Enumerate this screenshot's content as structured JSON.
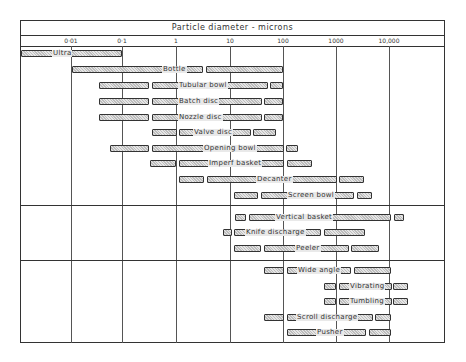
{
  "chart_data": {
    "type": "range-bar",
    "title": "Particle diameter - microns",
    "xlabel": "Particle diameter - microns",
    "xscale": "log",
    "xlim": [
      0.001,
      100000
    ],
    "tick_labels": [
      "0·01",
      "0·1",
      "1",
      "10",
      "100",
      "1000",
      "10,000"
    ],
    "tick_values": [
      0.01,
      0.1,
      1,
      10,
      100,
      1000,
      10000
    ],
    "groups": [
      {
        "name": "Sedimentation / disc-type",
        "rows": [
          {
            "label": "Ultra",
            "segments": [
              [
                0.001,
                0.1
              ]
            ]
          },
          {
            "label": "Bottle",
            "segments": [
              [
                0.01,
                2.5
              ],
              [
                3,
                100
              ]
            ]
          },
          {
            "label": "Tubular bowl",
            "segments": [
              [
                0.03,
                0.5
              ],
              [
                0.55,
                50
              ],
              [
                60,
                100
              ]
            ]
          },
          {
            "label": "Batch disc",
            "segments": [
              [
                0.03,
                0.5
              ],
              [
                0.55,
                40
              ],
              [
                45,
                100
              ]
            ]
          },
          {
            "label": "Nozzle disc",
            "segments": [
              [
                0.03,
                0.5
              ],
              [
                0.55,
                40
              ],
              [
                45,
                100
              ]
            ]
          },
          {
            "label": "Valve disc",
            "segments": [
              [
                0.55,
                1
              ],
              [
                1.1,
                25
              ],
              [
                28,
                80
              ]
            ]
          },
          {
            "label": "Opening bowl",
            "segments": [
              [
                0.05,
                0.5
              ],
              [
                0.55,
                100
              ],
              [
                110,
                180
              ]
            ]
          },
          {
            "label": "Imperf basket",
            "segments": [
              [
                0.5,
                1
              ],
              [
                1.1,
                100
              ],
              [
                120,
                300
              ]
            ]
          },
          {
            "label": "Decanter",
            "segments": [
              [
                1.1,
                3
              ],
              [
                3.3,
                1000
              ],
              [
                1100,
                3000
              ]
            ]
          },
          {
            "label": "Screen bowl",
            "segments": [
              [
                12,
                30
              ],
              [
                33,
                5000
              ],
              [
                5500,
                9000
              ]
            ]
          }
        ]
      },
      {
        "name": "Filtering batch",
        "rows": [
          {
            "label": "Vertical basket",
            "segments": [
              [
                12,
                18
              ],
              [
                20,
                10000
              ],
              [
                11000,
                16000
              ]
            ]
          },
          {
            "label": "Knife discharge",
            "segments": [
              [
                8,
                11
              ],
              [
                12,
                450
              ],
              [
                500,
                3000
              ]
            ]
          },
          {
            "label": "Peeler",
            "segments": [
              [
                12,
                30
              ],
              [
                33,
                2000
              ],
              [
                2100,
                6000
              ]
            ]
          }
        ]
      },
      {
        "name": "Filtering continuous",
        "rows": [
          {
            "label": "Wide angle",
            "segments": [
              [
                30,
                100
              ],
              [
                110,
                2000
              ],
              [
                2200,
                10000
              ]
            ]
          },
          {
            "label": "Vibrating",
            "segments": [
              [
                300,
                1000
              ],
              [
                1100,
                10000
              ],
              [
                10500,
                20000
              ]
            ]
          },
          {
            "label": "Tumbling",
            "segments": [
              [
                300,
                1000
              ],
              [
                1100,
                10000
              ],
              [
                10500,
                20000
              ]
            ]
          },
          {
            "label": "Scroll discharge",
            "segments": [
              [
                30,
                100
              ],
              [
                110,
                4000
              ],
              [
                4500,
                10000
              ]
            ]
          },
          {
            "label": "Pusher",
            "segments": [
              [
                100,
                3000
              ],
              [
                3300,
                10000
              ]
            ]
          }
        ]
      }
    ],
    "grid": true,
    "legend": "none"
  },
  "layout_rows": [
    {
      "label": "Ultra",
      "y": 50,
      "label_x": 52,
      "segs": [
        [
          21,
          122
        ]
      ]
    },
    {
      "label": "Bottle",
      "y": 66,
      "label_x": 162,
      "segs": [
        [
          72,
          203
        ],
        [
          206,
          283
        ]
      ]
    },
    {
      "label": "Tubular bowl",
      "y": 82,
      "label_x": 178,
      "segs": [
        [
          99,
          149
        ],
        [
          152,
          268
        ],
        [
          270,
          283
        ]
      ]
    },
    {
      "label": "Batch disc",
      "y": 98,
      "label_x": 178,
      "segs": [
        [
          99,
          149
        ],
        [
          152,
          262
        ],
        [
          264,
          283
        ]
      ]
    },
    {
      "label": "Nozzle disc",
      "y": 114,
      "label_x": 178,
      "segs": [
        [
          99,
          149
        ],
        [
          152,
          262
        ],
        [
          264,
          283
        ]
      ]
    },
    {
      "label": "Valve disc",
      "y": 129,
      "label_x": 193,
      "segs": [
        [
          152,
          177
        ],
        [
          179,
          251
        ],
        [
          253,
          276
        ]
      ]
    },
    {
      "label": "Opening bowl",
      "y": 145,
      "label_x": 203,
      "segs": [
        [
          110,
          149
        ],
        [
          152,
          284
        ],
        [
          286,
          298
        ]
      ]
    },
    {
      "label": "Imperf basket",
      "y": 160,
      "label_x": 208,
      "segs": [
        [
          150,
          176
        ],
        [
          179,
          284
        ],
        [
          287,
          312
        ]
      ]
    },
    {
      "label": "Decanter",
      "y": 176,
      "label_x": 256,
      "segs": [
        [
          179,
          204
        ],
        [
          207,
          337
        ],
        [
          339,
          364
        ]
      ]
    },
    {
      "label": "Screen bowl",
      "y": 192,
      "label_x": 287,
      "segs": [
        [
          234,
          258
        ],
        [
          261,
          354
        ],
        [
          357,
          372
        ]
      ]
    },
    {
      "label": "Vertical basket",
      "y": 214,
      "label_x": 275,
      "segs": [
        [
          235,
          246
        ],
        [
          249,
          391
        ],
        [
          394,
          404
        ]
      ]
    },
    {
      "label": "Knife discharge",
      "y": 229,
      "label_x": 245,
      "segs": [
        [
          223,
          232
        ],
        [
          234,
          321
        ],
        [
          324,
          365
        ]
      ]
    },
    {
      "label": "Peeler",
      "y": 245,
      "label_x": 295,
      "segs": [
        [
          234,
          261
        ],
        [
          264,
          349
        ],
        [
          351,
          379
        ]
      ]
    },
    {
      "label": "Wide angle",
      "y": 267,
      "label_x": 297,
      "segs": [
        [
          264,
          284
        ],
        [
          287,
          351
        ],
        [
          354,
          391
        ]
      ]
    },
    {
      "label": "Vibrating",
      "y": 283,
      "label_x": 349,
      "segs": [
        [
          324,
          336
        ],
        [
          339,
          392
        ],
        [
          393,
          408
        ]
      ]
    },
    {
      "label": "Tumbling",
      "y": 298,
      "label_x": 349,
      "segs": [
        [
          324,
          336
        ],
        [
          339,
          392
        ],
        [
          393,
          408
        ]
      ]
    },
    {
      "label": "Scroll discharge",
      "y": 314,
      "label_x": 296,
      "segs": [
        [
          264,
          284
        ],
        [
          287,
          373
        ],
        [
          375,
          391
        ]
      ]
    },
    {
      "label": "Pusher",
      "y": 329,
      "label_x": 316,
      "segs": [
        [
          287,
          366
        ],
        [
          369,
          391
        ]
      ]
    }
  ],
  "layout_ticks": [
    {
      "label": "0·01",
      "x": 71
    },
    {
      "label": "0·1",
      "x": 122
    },
    {
      "label": "1",
      "x": 176
    },
    {
      "label": "10",
      "x": 230
    },
    {
      "label": "100",
      "x": 283
    },
    {
      "label": "1000",
      "x": 336
    },
    {
      "label": "10,000",
      "x": 389
    }
  ],
  "layout_dividers": [
    205,
    260
  ]
}
